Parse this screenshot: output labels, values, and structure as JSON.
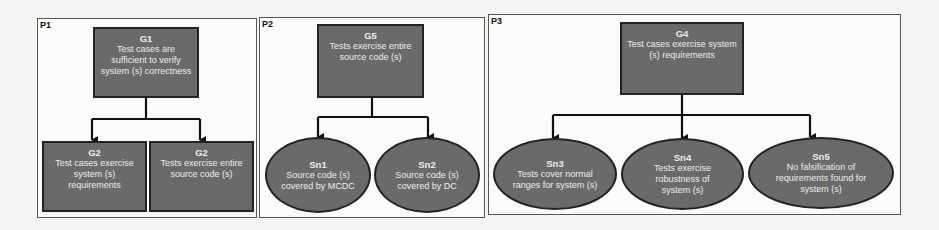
{
  "colors": {
    "node_fill": "#6a6a6a",
    "node_border": "#222222",
    "node_text": "#ececec",
    "connector": "#111111"
  },
  "panels": [
    {
      "label": "P1",
      "root": {
        "id": "G1",
        "type": "goal",
        "text": "Test cases are sufficient to verify system (s) correctness"
      },
      "children": [
        {
          "id": "G2",
          "type": "goal",
          "text": "Test cases exercise system (s) requirements"
        },
        {
          "id": "G2",
          "type": "goal",
          "text": "Tests exercise entire source code (s)"
        }
      ]
    },
    {
      "label": "P2",
      "root": {
        "id": "G5",
        "type": "goal",
        "text": "Tests exercise entire source code (s)"
      },
      "children": [
        {
          "id": "Sn1",
          "type": "solution",
          "text": "Source code (s) covered by MCDC"
        },
        {
          "id": "Sn2",
          "type": "solution",
          "text": "Source code (s) covered by DC"
        }
      ]
    },
    {
      "label": "P3",
      "root": {
        "id": "G4",
        "type": "goal",
        "text": "Test cases exercise system (s) requirements"
      },
      "children": [
        {
          "id": "Sn3",
          "type": "solution",
          "text": "Tests cover normal ranges for system (s)"
        },
        {
          "id": "Sn4",
          "type": "solution",
          "text": "Tests exercise robustness of system (s)"
        },
        {
          "id": "Sn5",
          "type": "solution",
          "text": "No falsification of requirements found for system (s)"
        }
      ]
    }
  ]
}
